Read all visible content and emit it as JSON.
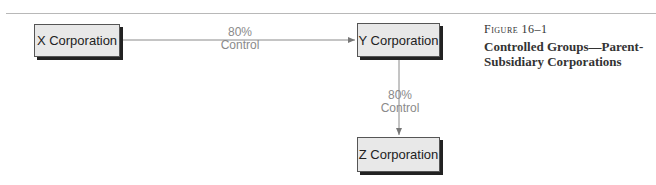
{
  "diagram": {
    "nodes": [
      {
        "id": "x",
        "label": "X Corporation"
      },
      {
        "id": "y",
        "label": "Y Corporation"
      },
      {
        "id": "z",
        "label": "Z Corporation"
      }
    ],
    "edges": [
      {
        "from": "x",
        "to": "y",
        "percent": "80%",
        "label": "Control"
      },
      {
        "from": "y",
        "to": "z",
        "percent": "80%",
        "label": "Control"
      }
    ]
  },
  "caption": {
    "figure_number": "Figure 16–1",
    "title": "Controlled Groups—Parent-Subsidiary Corporations"
  },
  "colors": {
    "box_fill": "#e8e8e8",
    "line": "#8a8a8a",
    "text": "#222222"
  }
}
